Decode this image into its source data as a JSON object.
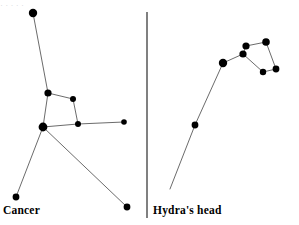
{
  "figure": {
    "width": 299,
    "height": 225,
    "background_color": "#ffffff",
    "star_color": "#000000",
    "line_color": "#5a5a5a",
    "divider_color": "#4a4a4a",
    "artifact_color": "#d8d8dc",
    "artifact_text": "·   ·      ·        ·       ·"
  },
  "divider": {
    "x": 147,
    "y1": 12,
    "y2": 218
  },
  "panels": [
    {
      "id": "cancer",
      "label": "Cancer",
      "label_x": 3,
      "label_y": 204
    },
    {
      "id": "hydra",
      "label": "Hydra's head",
      "label_x": 153,
      "label_y": 204
    }
  ],
  "chart_data": {
    "type": "scatter",
    "title": "",
    "xlabel": "",
    "ylabel": "",
    "xlim": [
      0,
      299
    ],
    "ylim": [
      225,
      0
    ],
    "grid": false,
    "legend": "none",
    "series": [
      {
        "name": "Cancer",
        "label": "Cancer",
        "stars": [
          {
            "id": "cnc-1",
            "x": 33,
            "y": 13,
            "r": 4.2
          },
          {
            "id": "cnc-2",
            "x": 48,
            "y": 93,
            "r": 3.6
          },
          {
            "id": "cnc-3",
            "x": 73,
            "y": 99,
            "r": 3.0
          },
          {
            "id": "cnc-4",
            "x": 78,
            "y": 124,
            "r": 3.0
          },
          {
            "id": "cnc-5",
            "x": 43,
            "y": 127,
            "r": 4.4
          },
          {
            "id": "cnc-6",
            "x": 124,
            "y": 122,
            "r": 2.8
          },
          {
            "id": "cnc-7",
            "x": 16,
            "y": 197,
            "r": 3.4
          },
          {
            "id": "cnc-8",
            "x": 127,
            "y": 207,
            "r": 3.4
          }
        ],
        "lines": [
          {
            "from": "cnc-1",
            "to": "cnc-2"
          },
          {
            "from": "cnc-2",
            "to": "cnc-3"
          },
          {
            "from": "cnc-3",
            "to": "cnc-4"
          },
          {
            "from": "cnc-4",
            "to": "cnc-5"
          },
          {
            "from": "cnc-2",
            "to": "cnc-5"
          },
          {
            "from": "cnc-4",
            "to": "cnc-6"
          },
          {
            "from": "cnc-5",
            "to": "cnc-7"
          },
          {
            "from": "cnc-5",
            "to": "cnc-8"
          }
        ]
      },
      {
        "name": "Hydra's head",
        "label": "Hydra's head",
        "stars": [
          {
            "id": "hya-1",
            "x": 223,
            "y": 63,
            "r": 4.2
          },
          {
            "id": "hya-2",
            "x": 243,
            "y": 54,
            "r": 3.6
          },
          {
            "id": "hya-3",
            "x": 246,
            "y": 46,
            "r": 3.6
          },
          {
            "id": "hya-4",
            "x": 266,
            "y": 42,
            "r": 3.8
          },
          {
            "id": "hya-5",
            "x": 276,
            "y": 69,
            "r": 3.4
          },
          {
            "id": "hya-6",
            "x": 263,
            "y": 72,
            "r": 3.2
          },
          {
            "id": "hya-7",
            "x": 195,
            "y": 125,
            "r": 3.4
          }
        ],
        "lines": [
          {
            "from": "hya-1",
            "to": "hya-2"
          },
          {
            "from": "hya-2",
            "to": "hya-3"
          },
          {
            "from": "hya-3",
            "to": "hya-4"
          },
          {
            "from": "hya-4",
            "to": "hya-5"
          },
          {
            "from": "hya-5",
            "to": "hya-6"
          },
          {
            "from": "hya-6",
            "to": "hya-2"
          },
          {
            "from": "hya-1",
            "to": "hya-7"
          }
        ],
        "tail": {
          "from": "hya-7",
          "x": 170,
          "y": 189
        }
      }
    ]
  }
}
